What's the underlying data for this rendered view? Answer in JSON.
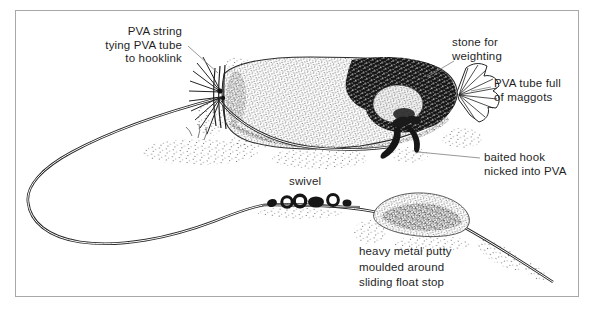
{
  "figure": {
    "type": "fishing-rig-illustration",
    "background_color": "#ffffff",
    "frame_border_color": "#a8a8a8",
    "ink_color": "#1d1d1d",
    "pointer_line_color": "#8c8c8c"
  },
  "labels": {
    "pva_string": {
      "lines": [
        "PVA string",
        "tying PVA tube",
        "to hooklink"
      ]
    },
    "stone": {
      "lines": [
        "stone for",
        "weighting"
      ]
    },
    "pva_tube": {
      "lines": [
        "PVA tube full",
        "of maggots"
      ]
    },
    "baited_hook": {
      "lines": [
        "baited hook",
        "nicked into PVA"
      ]
    },
    "swivel": {
      "lines": [
        "swivel"
      ]
    },
    "putty": {
      "lines": [
        "heavy metal putty",
        "moulded around",
        "sliding float stop"
      ]
    }
  }
}
